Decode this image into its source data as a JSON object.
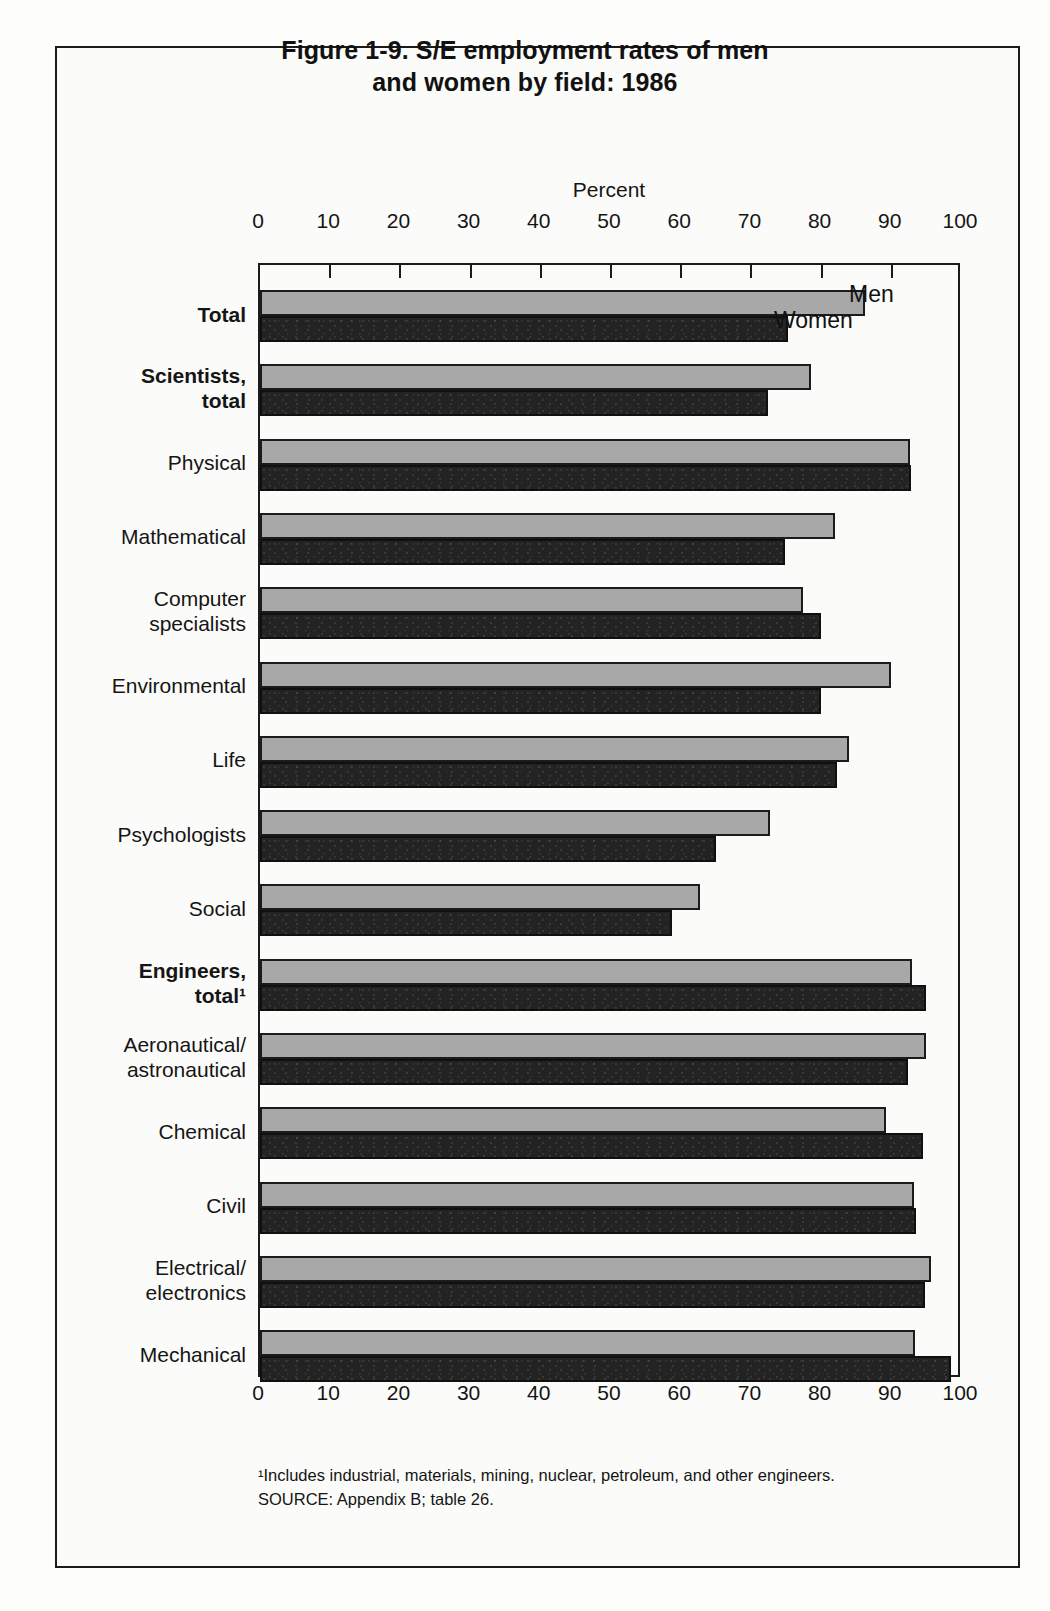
{
  "figure": {
    "title_line1": "Figure 1-9.  S/E employment rates of men",
    "title_line2": "and women by field: 1986",
    "axis_title": "Percent"
  },
  "footnotes": {
    "note1": "¹Includes industrial, materials, mining, nuclear, petroleum, and other engineers.",
    "source": "SOURCE:  Appendix B; table 26."
  },
  "legend": {
    "men": "Men",
    "women": "Women"
  },
  "chart_data": {
    "type": "bar",
    "orientation": "horizontal",
    "title": "Figure 1-9.  S/E employment rates of men and women by field: 1986",
    "xlabel": "Percent",
    "ylabel": "",
    "xlim": [
      0,
      100
    ],
    "xticks": [
      0,
      10,
      20,
      30,
      40,
      50,
      60,
      70,
      80,
      90,
      100
    ],
    "xtick_labels": [
      "0",
      "10",
      "20",
      "30",
      "40",
      "50",
      "60",
      "70",
      "80",
      "90",
      "100"
    ],
    "grid": false,
    "legend_position": "inside-top-right",
    "categories": [
      "Total",
      "Scientists,\ntotal",
      "Physical",
      "Mathematical",
      "Computer\nspecialists",
      "Environmental",
      "Life",
      "Psychologists",
      "Social",
      "Engineers,\ntotal¹",
      "Aeronautical/\nastronautical",
      "Chemical",
      "Civil",
      "Electrical/\nelectronics",
      "Mechanical"
    ],
    "category_bold": [
      true,
      true,
      false,
      false,
      false,
      false,
      false,
      false,
      false,
      true,
      false,
      false,
      false,
      false,
      false
    ],
    "series": [
      {
        "name": "Men",
        "color": "#a8a8a8",
        "values": [
          86.2,
          78.5,
          92.6,
          81.9,
          77.4,
          89.9,
          83.9,
          72.6,
          62.7,
          92.9,
          94.9,
          89.2,
          93.2,
          95.6,
          93.3
        ]
      },
      {
        "name": "Women",
        "color": "#232323",
        "values": [
          75.2,
          72.4,
          92.7,
          74.8,
          79.9,
          79.9,
          82.2,
          65.0,
          58.7,
          94.9,
          92.3,
          94.4,
          93.5,
          94.8,
          98.4
        ]
      }
    ]
  }
}
